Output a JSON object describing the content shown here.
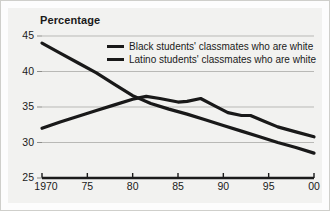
{
  "chart_data": {
    "type": "line",
    "title": "Percentage",
    "xlabel": "",
    "ylabel": "",
    "ylim": [
      25,
      45
    ],
    "xlim": [
      1970,
      2000
    ],
    "grid": true,
    "legend_position": "top-right-inside",
    "ytick_labels": [
      "45",
      "40",
      "35",
      "30",
      "25"
    ],
    "ytick_values": [
      45,
      40,
      35,
      30,
      25
    ],
    "xtick_labels": [
      "1970",
      "75",
      "80",
      "85",
      "90",
      "95",
      "00"
    ],
    "xtick_values": [
      1970,
      1975,
      1980,
      1985,
      1990,
      1995,
      2000
    ],
    "series": [
      {
        "name": "Black students' classmates who are white",
        "color": "#191919",
        "x": [
          1970,
          1972,
          1974,
          1976,
          1978,
          1980,
          1982,
          1984,
          1986,
          1988,
          1990,
          1992,
          1994,
          1996,
          1998,
          2000
        ],
        "values": [
          44.0,
          42.6,
          41.2,
          39.8,
          38.2,
          36.6,
          35.5,
          34.7,
          34.0,
          33.2,
          32.4,
          31.6,
          30.8,
          30.0,
          29.3,
          28.5
        ]
      },
      {
        "name": "Latino students' classmates who are white",
        "color": "#191919",
        "x": [
          1970,
          1972,
          1974,
          1976,
          1978,
          1980,
          1981.5,
          1983,
          1985,
          1986,
          1987.5,
          1989,
          1990.5,
          1992,
          1993,
          1994.5,
          1996,
          1998,
          2000
        ],
        "values": [
          32.0,
          32.9,
          33.7,
          34.5,
          35.3,
          36.1,
          36.5,
          36.2,
          35.7,
          35.8,
          36.2,
          35.2,
          34.2,
          33.8,
          33.8,
          33.0,
          32.2,
          31.5,
          30.8
        ]
      }
    ]
  }
}
